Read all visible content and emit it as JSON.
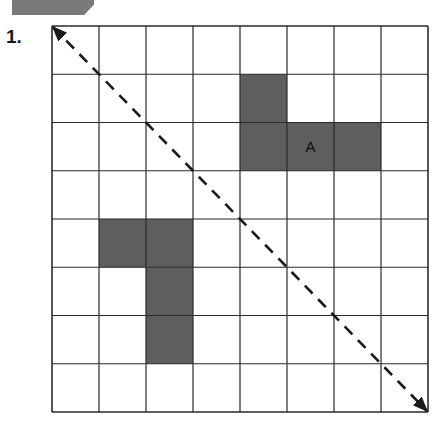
{
  "header": {
    "exercise_number": "1."
  },
  "grid": {
    "rows": 8,
    "cols": 8,
    "line_color": "#2a2a2a",
    "fill_color": "#5e5e5e",
    "shaded_cells": [
      {
        "row": 1,
        "col": 4
      },
      {
        "row": 2,
        "col": 4
      },
      {
        "row": 2,
        "col": 5,
        "label": "A"
      },
      {
        "row": 2,
        "col": 6
      },
      {
        "row": 4,
        "col": 1
      },
      {
        "row": 4,
        "col": 2
      },
      {
        "row": 5,
        "col": 2
      },
      {
        "row": 6,
        "col": 2
      }
    ],
    "labels": {
      "shape_a": "A"
    },
    "mirror_line": {
      "style": "dashed",
      "from": "top-left corner",
      "to": "bottom-right corner",
      "arrowheads": "both ends"
    }
  }
}
